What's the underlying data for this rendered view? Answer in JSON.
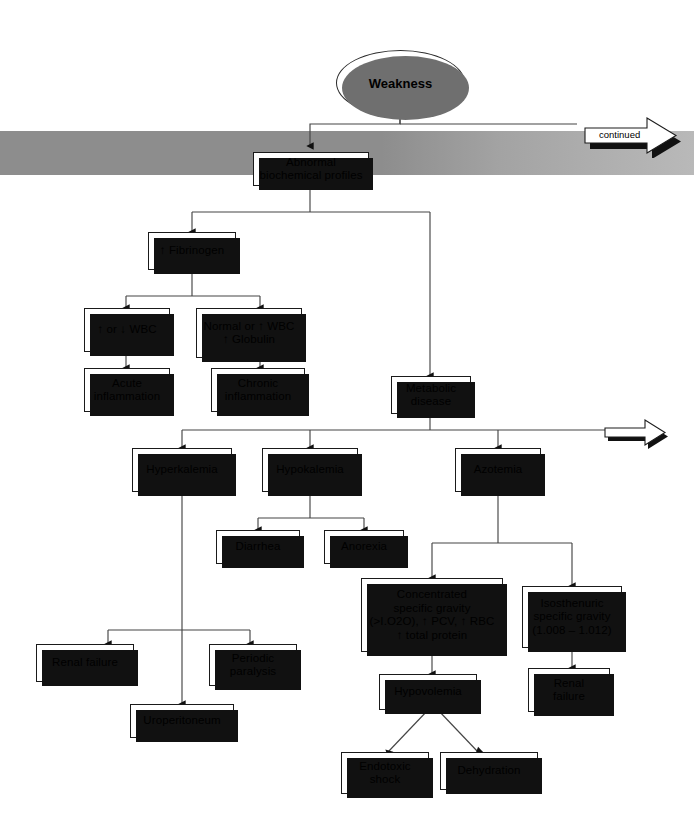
{
  "diagram": {
    "band_color": "#8d8d8d",
    "box_border_color": "#1a1a1a",
    "shadow_color": "#111111"
  },
  "nodes": {
    "weakness": {
      "label": "Weakness"
    },
    "abnormal_profiles": {
      "label": "Abnormal\nbiochemical profiles"
    },
    "fibrinogen": {
      "label": "↑ Fibrinogen"
    },
    "wbc_up_down": {
      "label": "↑ or ↓  WBC"
    },
    "normal_wbc_globulin": {
      "label": "Normal or ↑ WBC\n↑ Globulin"
    },
    "acute_inflammation": {
      "label": "Acute\ninflammation"
    },
    "chronic_inflammation": {
      "label": "Chronic\ninflammation"
    },
    "metabolic_disease": {
      "label": "Metabolic\ndisease"
    },
    "hyperkalemia": {
      "label": "Hyperkalemia"
    },
    "hypokalemia": {
      "label": "Hypokalemia"
    },
    "azotemia": {
      "label": "Azotemia"
    },
    "diarrhea": {
      "label": "Diarrhea"
    },
    "anorexia": {
      "label": "Anorexia"
    },
    "concentrated_sg": {
      "label": "Concentrated\nspecific gravity\n(>I.O2O), ↑ PCV, ↑ RBC\n↑ total protein"
    },
    "isosthenuric_sg": {
      "label": "Isosthenuric\nspecific gravity\n(1.008 – 1.012)"
    },
    "renal_failure_left": {
      "label": "Renal failure"
    },
    "periodic_paralysis": {
      "label": "Periodic\nparalysis"
    },
    "uroperitoneum": {
      "label": "Uroperitoneum"
    },
    "hypovolemia": {
      "label": "Hypovolemia"
    },
    "renal_failure_right": {
      "label": "Renal\nfailure"
    },
    "endotoxic_shock": {
      "label": "Endotoxic\nshock"
    },
    "dehydration": {
      "label": "Dehydration"
    }
  },
  "arrows": {
    "continued": {
      "label": "continued"
    },
    "continued_lower": {
      "label": ""
    }
  }
}
